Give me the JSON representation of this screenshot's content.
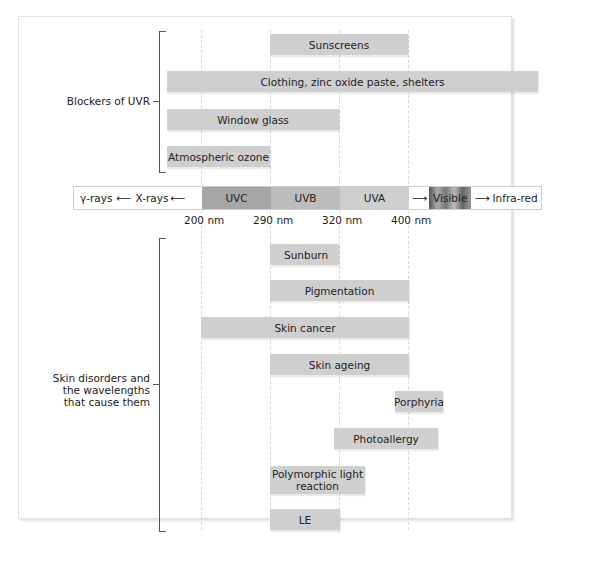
{
  "blockers": {
    "group_label": "Blockers of UVR",
    "bars": [
      {
        "label": "Sunscreens",
        "from_nm": 290,
        "to_nm": 400
      },
      {
        "label": "Clothing, zinc oxide paste, shelters",
        "from_nm": "<200",
        "to_nm": ">infra-red"
      },
      {
        "label": "Window glass",
        "from_nm": "<200",
        "to_nm": 320
      },
      {
        "label": "Atmospheric ozone",
        "from_nm": "<200",
        "to_nm": 290
      }
    ]
  },
  "spectrum": {
    "gamma": "γ-rays",
    "xrays": "X-rays",
    "uvc": "UVC",
    "uvb": "UVB",
    "uva": "UVA",
    "visible": "Visible",
    "infrared": "Infra-red",
    "ticks": [
      "200 nm",
      "290 nm",
      "320 nm",
      "400 nm"
    ],
    "colors": {
      "uvc": "#a6a6a6",
      "uvb": "#bcbcbc",
      "uva": "#cfcfcf"
    }
  },
  "disorders": {
    "group_label_lines": [
      "Skin disorders and",
      "the wavelengths",
      "that cause them"
    ],
    "bars": [
      {
        "label": "Sunburn",
        "from_nm": 290,
        "to_nm": 320
      },
      {
        "label": "Pigmentation",
        "from_nm": 290,
        "to_nm": 400
      },
      {
        "label": "Skin cancer",
        "from_nm": 200,
        "to_nm": 400
      },
      {
        "label": "Skin ageing",
        "from_nm": 290,
        "to_nm": 400
      },
      {
        "label": "Porphyria",
        "from_nm": "~390",
        "to_nm": "~420"
      },
      {
        "label": "Photoallergy",
        "from_nm": "~310",
        "to_nm": "~430"
      },
      {
        "label": "Polymorphic light reaction",
        "from_nm": 290,
        "to_nm": "~350"
      },
      {
        "label": "LE",
        "from_nm": 290,
        "to_nm": 320
      }
    ]
  }
}
